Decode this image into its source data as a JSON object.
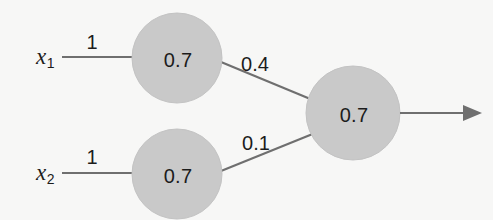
{
  "diagram": {
    "type": "neural-network",
    "background_color": "#f7f7f6",
    "node_fill_color": "#c9c9c9",
    "edge_color": "#6f6f6f",
    "text_color": "#1c1c1c",
    "inputs": [
      {
        "id": "x1",
        "label": "x",
        "subscript": "1"
      },
      {
        "id": "x2",
        "label": "x",
        "subscript": "2"
      }
    ],
    "nodes": [
      {
        "id": "hidden-top",
        "value": "0.7"
      },
      {
        "id": "hidden-bottom",
        "value": "0.7"
      },
      {
        "id": "output",
        "value": "0.7"
      }
    ],
    "weights": [
      {
        "id": "w-x1-hidden-top",
        "value": "1"
      },
      {
        "id": "w-x2-hidden-bottom",
        "value": "1"
      },
      {
        "id": "w-hidden-top-output",
        "value": "0.4"
      },
      {
        "id": "w-hidden-bottom-output",
        "value": "0.1"
      }
    ],
    "output_arrow": {
      "id": "output-arrow",
      "direction": "right"
    }
  }
}
